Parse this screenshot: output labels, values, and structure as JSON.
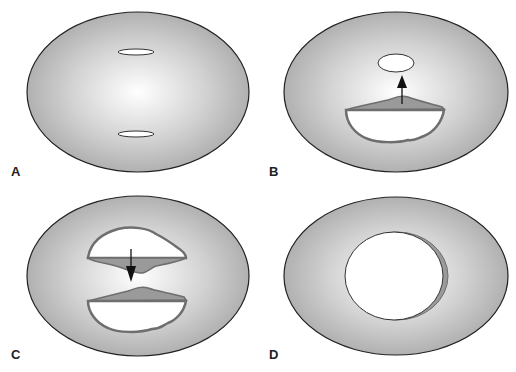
{
  "figure": {
    "colors": {
      "background": "#ffffff",
      "oval_fill_center": "#ffffff",
      "oval_fill_edge": "#a8a8a8",
      "outline": "#222222",
      "flap_fill": "#9a9a9a",
      "flap_outline": "#6e6e6e",
      "arrow": "#111111"
    },
    "panels": [
      {
        "id": "A",
        "label": "A",
        "content": "Two small horizontal slits, one above and one below center"
      },
      {
        "id": "B",
        "label": "B",
        "content": "Upper small oval opening; lower slit enlarged into a flap with an upward arrow"
      },
      {
        "id": "C",
        "label": "C",
        "content": "Two opposing flap openings with a downward arrow between them"
      },
      {
        "id": "D",
        "label": "D",
        "content": "Single large central circular opening"
      }
    ]
  }
}
